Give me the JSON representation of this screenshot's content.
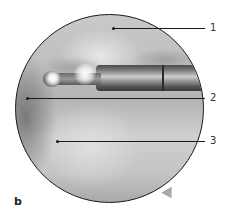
{
  "figure": {
    "panel_label": "b",
    "labels": [
      {
        "number": "1"
      },
      {
        "number": "2"
      },
      {
        "number": "3"
      }
    ]
  }
}
